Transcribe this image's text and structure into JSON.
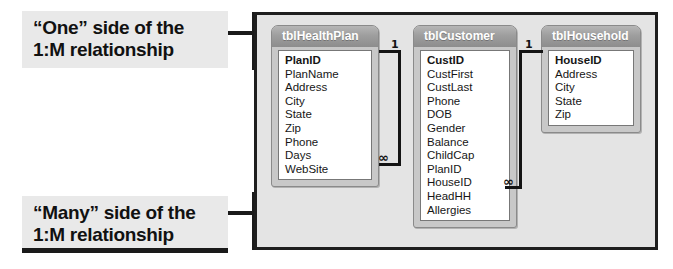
{
  "callouts": {
    "one": {
      "line1": "“One” side of the",
      "line2": "1:M relationship"
    },
    "many": {
      "line1": "“Many” side of the",
      "line2": "1:M relationship"
    }
  },
  "diagram": {
    "tables": [
      {
        "name": "tblHealthPlan",
        "title": "tblHealthPlan",
        "fields": [
          {
            "name": "PlanID",
            "pk": true
          },
          {
            "name": "PlanName",
            "pk": false
          },
          {
            "name": "Address",
            "pk": false
          },
          {
            "name": "City",
            "pk": false
          },
          {
            "name": "State",
            "pk": false
          },
          {
            "name": "Zip",
            "pk": false
          },
          {
            "name": "Phone",
            "pk": false
          },
          {
            "name": "Days",
            "pk": false
          },
          {
            "name": "WebSite",
            "pk": false
          }
        ]
      },
      {
        "name": "tblCustomer",
        "title": "tblCustomer",
        "fields": [
          {
            "name": "CustID",
            "pk": true
          },
          {
            "name": "CustFirst",
            "pk": false
          },
          {
            "name": "CustLast",
            "pk": false
          },
          {
            "name": "Phone",
            "pk": false
          },
          {
            "name": "DOB",
            "pk": false
          },
          {
            "name": "Gender",
            "pk": false
          },
          {
            "name": "Balance",
            "pk": false
          },
          {
            "name": "ChildCap",
            "pk": false
          },
          {
            "name": "PlanID",
            "pk": false
          },
          {
            "name": "HouseID",
            "pk": false
          },
          {
            "name": "HeadHH",
            "pk": false
          },
          {
            "name": "Allergies",
            "pk": false
          }
        ]
      },
      {
        "name": "tblHousehold",
        "title": "tblHousehold",
        "fields": [
          {
            "name": "HouseID",
            "pk": true
          },
          {
            "name": "Address",
            "pk": false
          },
          {
            "name": "City",
            "pk": false
          },
          {
            "name": "State",
            "pk": false
          },
          {
            "name": "Zip",
            "pk": false
          }
        ]
      }
    ],
    "relationships": [
      {
        "id": "rel1",
        "from_table": "tblHealthPlan",
        "from_field": "PlanID",
        "to_table": "tblCustomer",
        "to_field": "PlanID",
        "one_symbol": "1",
        "many_symbol": "∞"
      },
      {
        "id": "rel2",
        "from_table": "tblHousehold",
        "from_field": "HouseID",
        "to_table": "tblCustomer",
        "to_field": "HouseID",
        "one_symbol": "1",
        "many_symbol": "∞"
      }
    ]
  },
  "colors": {
    "callout_bg": "#e9e9e9",
    "canvas_bg": "#e4e4e4",
    "frame_border": "#1e1e1e",
    "table_header": "#9e9e9e",
    "table_body": "#ffffff",
    "line": "#141414"
  }
}
